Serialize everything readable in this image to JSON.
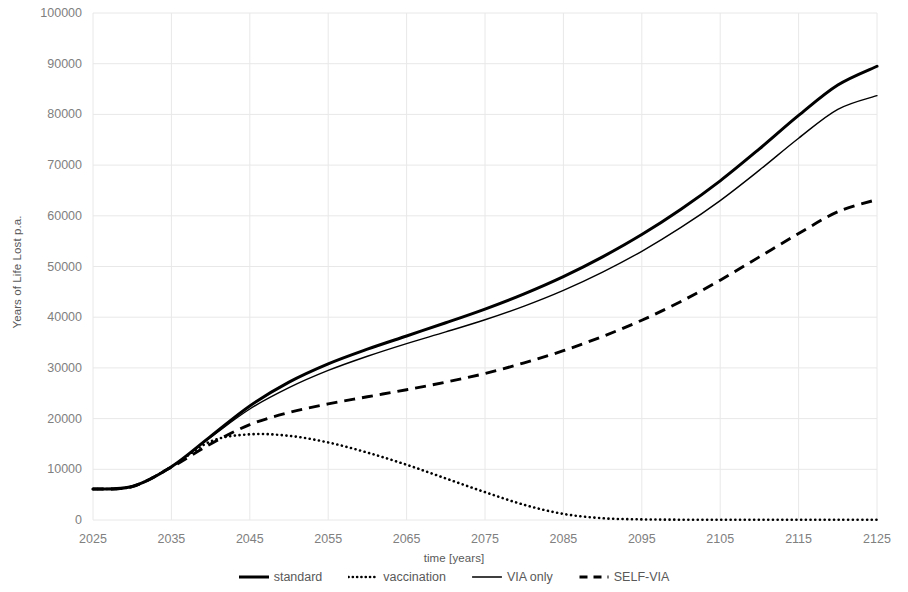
{
  "chart_data": {
    "type": "line",
    "title": "",
    "subtitle": "",
    "xlabel": "time [years]",
    "ylabel": "Years of Life Lost p.a.",
    "xlim": [
      2025,
      2125
    ],
    "ylim": [
      0,
      100000
    ],
    "grid": true,
    "legend_position": "bottom",
    "x_ticks": [
      2025,
      2035,
      2045,
      2055,
      2065,
      2075,
      2085,
      2095,
      2105,
      2115,
      2125
    ],
    "y_ticks": [
      0,
      10000,
      20000,
      30000,
      40000,
      50000,
      60000,
      70000,
      80000,
      90000,
      100000
    ],
    "x": [
      2025,
      2030,
      2035,
      2040,
      2045,
      2050,
      2055,
      2060,
      2065,
      2070,
      2075,
      2080,
      2085,
      2090,
      2095,
      2100,
      2105,
      2110,
      2115,
      2120,
      2125
    ],
    "series": [
      {
        "name": "standard",
        "style": "solid-thick",
        "color": "#000000",
        "values": [
          6100,
          6600,
          10500,
          16500,
          22500,
          27200,
          30800,
          33700,
          36300,
          38900,
          41600,
          44600,
          48000,
          51900,
          56300,
          61300,
          66900,
          73200,
          79800,
          85800,
          89500
        ]
      },
      {
        "name": "vaccination",
        "style": "dotted",
        "color": "#000000",
        "values": [
          6100,
          6600,
          10500,
          15500,
          16900,
          16600,
          15300,
          13300,
          10900,
          8200,
          5500,
          3000,
          1200,
          350,
          120,
          60,
          50,
          45,
          45,
          45,
          45
        ]
      },
      {
        "name": "VIA only",
        "style": "solid-thin",
        "color": "#000000",
        "values": [
          6100,
          6600,
          10500,
          16300,
          21900,
          26100,
          29500,
          32300,
          34800,
          37100,
          39500,
          42200,
          45300,
          48900,
          53000,
          57700,
          63000,
          69000,
          75300,
          81000,
          83700
        ]
      },
      {
        "name": "SELF-VIA",
        "style": "dashed",
        "color": "#000000",
        "values": [
          6100,
          6600,
          10400,
          15000,
          18800,
          21200,
          22900,
          24300,
          25700,
          27200,
          28900,
          31000,
          33400,
          36200,
          39400,
          43100,
          47300,
          51900,
          56500,
          60800,
          63200
        ]
      }
    ]
  },
  "axes": {
    "y_title": "Years of Life Lost p.a.",
    "x_title": "time [years]",
    "y_tick_labels": [
      "100000",
      "90000",
      "80000",
      "70000",
      "60000",
      "50000",
      "40000",
      "30000",
      "20000",
      "10000",
      "0"
    ],
    "x_tick_labels": [
      "2025",
      "2035",
      "2045",
      "2055",
      "2065",
      "2075",
      "2085",
      "2095",
      "2105",
      "2115",
      "2125"
    ]
  },
  "legend": {
    "items": [
      {
        "label": "standard",
        "style": "solid-thick"
      },
      {
        "label": "vaccination",
        "style": "dotted"
      },
      {
        "label": "VIA only",
        "style": "solid-thin"
      },
      {
        "label": "SELF-VIA",
        "style": "dashed"
      }
    ]
  },
  "colors": {
    "line": "#000000",
    "grid": "#e8e8e8",
    "text": "#595959",
    "tick_text": "#808080",
    "background": "#ffffff"
  }
}
